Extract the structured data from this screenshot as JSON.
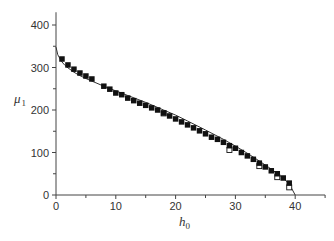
{
  "chart_data": {
    "type": "scatter",
    "title": "",
    "xlabel": "h0",
    "ylabel": "μ1",
    "xlabel_parts": {
      "main": "h",
      "sub": "0"
    },
    "ylabel_parts": {
      "main": "μ",
      "sub": "1"
    },
    "xlim": [
      0,
      45
    ],
    "ylim": [
      0,
      430
    ],
    "x_ticks": [
      0,
      10,
      20,
      30,
      40
    ],
    "y_ticks": [
      0,
      100,
      200,
      300,
      400
    ],
    "x_tick_labels": [
      "0",
      "10",
      "20",
      "30",
      "40"
    ],
    "y_tick_labels": [
      "0",
      "100",
      "200",
      "300",
      "400"
    ],
    "grid": false,
    "legend": null,
    "series": [
      {
        "name": "filled squares",
        "marker": "filled-square",
        "color": "#111111",
        "x": [
          1,
          2,
          3,
          4,
          5,
          6,
          8,
          9,
          10,
          11,
          12,
          13,
          14,
          15,
          16,
          17,
          18,
          19,
          20,
          21,
          22,
          23,
          24,
          25,
          26,
          27,
          28,
          29,
          30,
          31,
          32,
          33,
          34,
          35,
          36,
          37,
          38,
          39
        ],
        "y": [
          320,
          306,
          296,
          287,
          280,
          273,
          256,
          249,
          240,
          236,
          228,
          222,
          216,
          211,
          205,
          200,
          193,
          186,
          179,
          172,
          165,
          158,
          151,
          144,
          136,
          131,
          124,
          116,
          110,
          100,
          92,
          84,
          75,
          66,
          57,
          50,
          40,
          28
        ]
      },
      {
        "name": "open squares",
        "marker": "open-square",
        "color": "#111111",
        "x": [
          18,
          29,
          34,
          37,
          39
        ],
        "y": [
          192,
          106,
          68,
          42,
          18
        ]
      },
      {
        "name": "theory curve",
        "marker": "line",
        "color": "#333333",
        "x": [
          0,
          0.3,
          0.7,
          1,
          1.5,
          2,
          3,
          4,
          5,
          6,
          8,
          10,
          12,
          15,
          18,
          20,
          22,
          25,
          28,
          30,
          32,
          34,
          36,
          38,
          39,
          40
        ],
        "y": [
          348,
          330,
          320,
          313,
          305,
          299,
          289,
          281,
          274,
          268,
          256,
          245,
          234,
          218,
          200,
          188,
          174,
          153,
          131,
          115,
          98,
          80,
          61,
          40,
          26,
          0
        ]
      }
    ]
  }
}
